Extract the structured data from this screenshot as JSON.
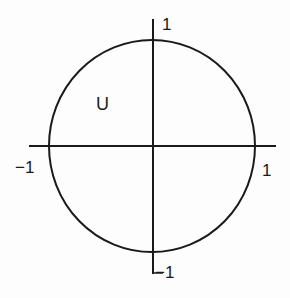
{
  "diagram": {
    "type": "unit-circle",
    "region_label": "U",
    "axes": {
      "x_positive_label": "1",
      "x_negative_label": "−1",
      "y_positive_label": "1",
      "y_negative_label": "−1"
    },
    "colors": {
      "stroke": "#1a1a1a",
      "background": "#fdfdfd"
    }
  }
}
